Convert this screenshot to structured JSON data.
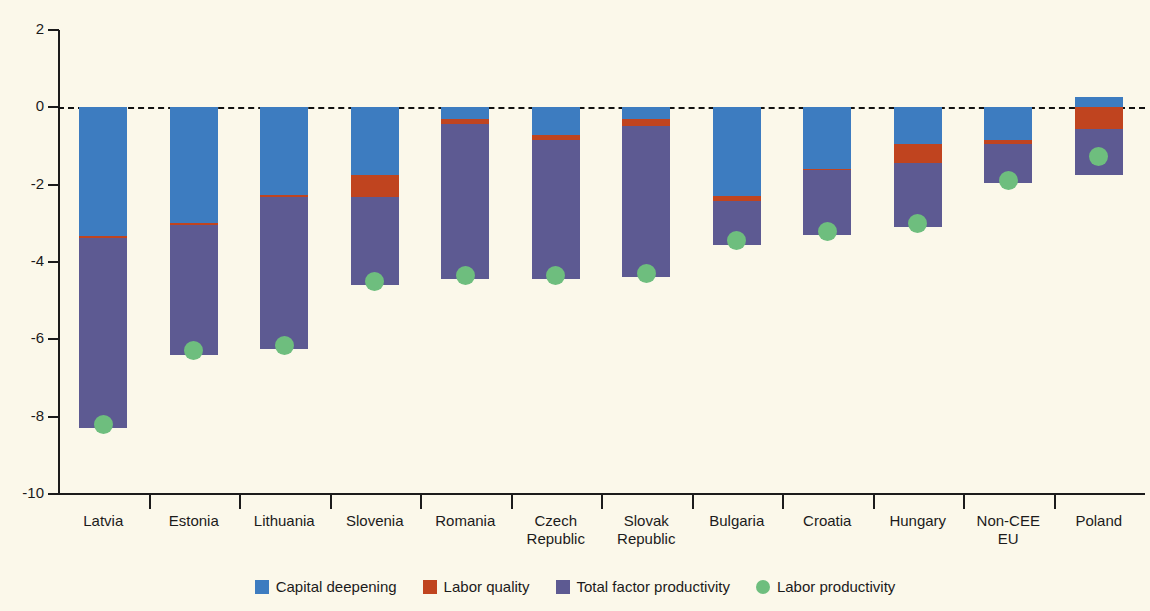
{
  "chart_data": {
    "type": "bar",
    "stacked": true,
    "title": "",
    "xlabel": "",
    "ylabel": "",
    "ylim": [
      -10,
      2
    ],
    "yticks": [
      2,
      0,
      -2,
      -4,
      -6,
      -8,
      -10
    ],
    "ytick_labels": [
      "2",
      "0",
      "-2",
      "-4",
      "-6",
      "-8",
      "-10"
    ],
    "grid": false,
    "zero_reference_line": true,
    "legend_position": "bottom",
    "categories": [
      "Latvia",
      "Estonia",
      "Lithuania",
      "Slovenia",
      "Romania",
      "Czech\nRepublic",
      "Slovak\nRepublic",
      "Bulgaria",
      "Croatia",
      "Hungary",
      "Non-CEE\nEU",
      "Poland"
    ],
    "series": [
      {
        "name": "Capital deepening",
        "color": "#3d7cc0",
        "values": [
          -3.34,
          -3.0,
          -2.27,
          -1.74,
          -0.29,
          -0.72,
          -0.29,
          -2.3,
          -1.6,
          -0.95,
          -0.85,
          0.28
        ]
      },
      {
        "name": "Labor quality",
        "color": "#c0441f",
        "values": [
          -0.05,
          -0.05,
          -0.04,
          -0.59,
          -0.13,
          -0.13,
          -0.2,
          -0.12,
          -0.02,
          -0.5,
          -0.1,
          -0.56
        ]
      },
      {
        "name": "Total factor productivity",
        "color": "#5d5a92",
        "values": [
          -4.9,
          -3.35,
          -3.94,
          -2.27,
          -4.03,
          -3.6,
          -3.91,
          -1.13,
          -1.68,
          -1.65,
          -1.0,
          -1.19
        ]
      }
    ],
    "marker_series": {
      "name": "Labor productivity",
      "color": "#6ebe7e",
      "marker": "circle",
      "values": [
        -8.2,
        -6.3,
        -6.15,
        -4.5,
        -4.35,
        -4.35,
        -4.3,
        -3.45,
        -3.2,
        -3.0,
        -1.9,
        -1.28
      ]
    },
    "bar_totals": [
      -8.29,
      -6.4,
      -6.25,
      -4.6,
      -4.45,
      -4.45,
      -4.4,
      -3.55,
      -3.3,
      -3.1,
      -1.95,
      -1.47
    ]
  },
  "legend": {
    "items": [
      {
        "label": "Capital deepening",
        "color": "#3d7cc0",
        "shape": "square"
      },
      {
        "label": "Labor quality",
        "color": "#c0441f",
        "shape": "square"
      },
      {
        "label": "Total factor productivity",
        "color": "#5d5a92",
        "shape": "square"
      },
      {
        "label": "Labor productivity",
        "color": "#6ebe7e",
        "shape": "circle"
      }
    ]
  },
  "colors": {
    "background": "#fbf8ea",
    "axis": "#1b1b1b",
    "capital_deepening": "#3d7cc0",
    "labor_quality": "#c0441f",
    "total_factor_productivity": "#5d5a92",
    "labor_productivity": "#6ebe7e"
  }
}
